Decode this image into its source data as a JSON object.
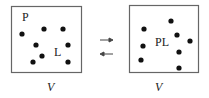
{
  "diagram": {
    "type": "equilibrium-binding-schematic",
    "left_box": {
      "label_P": "P",
      "label_L": "L",
      "volume_label": "V",
      "dots": [
        [
          22,
          34
        ],
        [
          44,
          29
        ],
        [
          63,
          29
        ],
        [
          36,
          45
        ],
        [
          68,
          45
        ],
        [
          42,
          56
        ],
        [
          33,
          62
        ],
        [
          68,
          62
        ]
      ]
    },
    "right_box": {
      "label_PL": "PL",
      "volume_label": "V",
      "dots": [
        [
          171,
          21
        ],
        [
          144,
          29
        ],
        [
          177,
          35
        ],
        [
          190,
          41
        ],
        [
          143,
          46
        ],
        [
          179,
          52
        ],
        [
          141,
          60
        ],
        [
          179,
          68
        ]
      ]
    },
    "arrows": {
      "forward": "→",
      "reverse": "←"
    },
    "colors": {
      "stroke": "#555555",
      "dot": "#111111",
      "text": "#222222"
    }
  }
}
